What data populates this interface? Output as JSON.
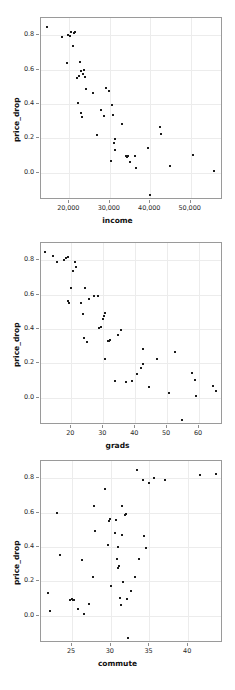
{
  "figure": {
    "width": 235,
    "height": 690,
    "background": "#ffffff",
    "point_color": "#1b1b1b",
    "grid_color": "#ececec",
    "frame_color": "#9a9a9a",
    "bottom_artifact": ""
  },
  "chart_data": [
    {
      "type": "scatter",
      "title": "",
      "xlabel": "income",
      "ylabel": "price_drop",
      "xticks": [
        20000,
        30000,
        40000,
        50000
      ],
      "xticklabels": [
        "20,000",
        "30,000",
        "40,000",
        "50,000"
      ],
      "yticks": [
        0.0,
        0.2,
        0.4,
        0.6,
        0.8
      ],
      "yticklabels": [
        "0.0",
        "0.2",
        "0.4",
        "0.6",
        "0.8"
      ],
      "xlim": [
        13000,
        58000
      ],
      "ylim": [
        -0.16,
        0.9
      ],
      "grid": true,
      "legend": "none",
      "points": [
        [
          14400,
          0.845
        ],
        [
          18200,
          0.787
        ],
        [
          19700,
          0.803
        ],
        [
          20100,
          0.795
        ],
        [
          20400,
          0.818
        ],
        [
          20900,
          0.737
        ],
        [
          21200,
          0.812
        ],
        [
          21500,
          0.82
        ],
        [
          19500,
          0.637
        ],
        [
          22600,
          0.642
        ],
        [
          22000,
          0.548
        ],
        [
          22300,
          0.56
        ],
        [
          22800,
          0.59
        ],
        [
          23300,
          0.572
        ],
        [
          23600,
          0.598
        ],
        [
          23900,
          0.555
        ],
        [
          24200,
          0.487
        ],
        [
          22100,
          0.405
        ],
        [
          23000,
          0.345
        ],
        [
          23100,
          0.325
        ],
        [
          25800,
          0.462
        ],
        [
          26900,
          0.218
        ],
        [
          28600,
          0.332
        ],
        [
          29000,
          0.495
        ],
        [
          29900,
          0.472
        ],
        [
          27800,
          0.363
        ],
        [
          30600,
          0.394
        ],
        [
          30900,
          0.333
        ],
        [
          31400,
          0.196
        ],
        [
          31000,
          0.172
        ],
        [
          31200,
          0.133
        ],
        [
          30200,
          0.068
        ],
        [
          33100,
          0.283
        ],
        [
          34000,
          0.095
        ],
        [
          34200,
          0.092
        ],
        [
          34500,
          0.098
        ],
        [
          35000,
          0.064
        ],
        [
          36200,
          0.094
        ],
        [
          36500,
          0.028
        ],
        [
          39400,
          0.141
        ],
        [
          40000,
          -0.129
        ],
        [
          42400,
          0.268
        ],
        [
          42600,
          0.225
        ],
        [
          44900,
          0.04
        ],
        [
          50600,
          0.103
        ],
        [
          55700,
          0.006
        ]
      ]
    },
    {
      "type": "scatter",
      "title": "",
      "xlabel": "grads",
      "ylabel": "price_drop",
      "xticks": [
        20,
        30,
        40,
        50,
        60
      ],
      "xticklabels": [
        "20",
        "30",
        "40",
        "50",
        "60"
      ],
      "yticks": [
        0.0,
        0.2,
        0.4,
        0.6,
        0.8
      ],
      "yticklabels": [
        "0.0",
        "0.2",
        "0.4",
        "0.6",
        "0.8"
      ],
      "xlim": [
        10.5,
        67.5
      ],
      "ylim": [
        -0.16,
        0.9
      ],
      "grid": true,
      "legend": "none",
      "points": [
        [
          11.8,
          0.845
        ],
        [
          14.4,
          0.825
        ],
        [
          15.6,
          0.787
        ],
        [
          17.6,
          0.803
        ],
        [
          18.2,
          0.812
        ],
        [
          18.9,
          0.818
        ],
        [
          19.1,
          0.563
        ],
        [
          19.2,
          0.551
        ],
        [
          20.0,
          0.637
        ],
        [
          20.6,
          0.735
        ],
        [
          21.2,
          0.787
        ],
        [
          21.6,
          0.76
        ],
        [
          22.9,
          0.553
        ],
        [
          23.8,
          0.487
        ],
        [
          24.3,
          0.64
        ],
        [
          24.0,
          0.345
        ],
        [
          24.8,
          0.325
        ],
        [
          25.4,
          0.571
        ],
        [
          27.0,
          0.594
        ],
        [
          28.3,
          0.592
        ],
        [
          28.8,
          0.405
        ],
        [
          29.3,
          0.41
        ],
        [
          29.9,
          0.46
        ],
        [
          30.1,
          0.472
        ],
        [
          30.4,
          0.495
        ],
        [
          30.5,
          0.222
        ],
        [
          31.4,
          0.332
        ],
        [
          31.8,
          0.327
        ],
        [
          32.0,
          0.334
        ],
        [
          33.6,
          0.094
        ],
        [
          34.7,
          0.366
        ],
        [
          35.5,
          0.393
        ],
        [
          37.2,
          0.092
        ],
        [
          38.9,
          0.094
        ],
        [
          40.5,
          0.135
        ],
        [
          41.8,
          0.172
        ],
        [
          42.3,
          0.196
        ],
        [
          42.6,
          0.283
        ],
        [
          44.2,
          0.064
        ],
        [
          46.8,
          0.225
        ],
        [
          50.6,
          0.028
        ],
        [
          52.6,
          0.268
        ],
        [
          54.8,
          -0.129
        ],
        [
          57.9,
          0.143
        ],
        [
          58.6,
          0.103
        ],
        [
          58.9,
          0.006
        ],
        [
          64.3,
          0.066
        ],
        [
          65.2,
          0.04
        ]
      ]
    },
    {
      "type": "scatter",
      "title": "",
      "xlabel": "commute",
      "ylabel": "price_drop",
      "xticks": [
        25,
        30,
        35,
        40
      ],
      "xticklabels": [
        "25",
        "30",
        "35",
        "40"
      ],
      "yticks": [
        0.0,
        0.2,
        0.4,
        0.6,
        0.8
      ],
      "yticklabels": [
        "0.0",
        "0.2",
        "0.4",
        "0.6",
        "0.8"
      ],
      "xlim": [
        21.0,
        44.5
      ],
      "ylim": [
        -0.16,
        0.9
      ],
      "grid": true,
      "legend": "none",
      "points": [
        [
          21.9,
          0.131
        ],
        [
          22.1,
          0.028
        ],
        [
          23.1,
          0.596
        ],
        [
          23.4,
          0.352
        ],
        [
          24.8,
          0.092
        ],
        [
          25.0,
          0.094
        ],
        [
          25.1,
          0.09
        ],
        [
          25.3,
          0.092
        ],
        [
          25.8,
          0.038
        ],
        [
          26.3,
          0.325
        ],
        [
          26.6,
          0.006
        ],
        [
          27.2,
          0.066
        ],
        [
          27.7,
          0.222
        ],
        [
          27.8,
          0.636
        ],
        [
          28.0,
          0.495
        ],
        [
          29.3,
          0.738
        ],
        [
          29.6,
          0.41
        ],
        [
          29.8,
          0.551
        ],
        [
          29.9,
          0.563
        ],
        [
          30.0,
          0.172
        ],
        [
          30.6,
          0.483
        ],
        [
          30.7,
          0.556
        ],
        [
          30.9,
          0.402
        ],
        [
          30.8,
          0.33
        ],
        [
          31.0,
          0.276
        ],
        [
          31.1,
          0.291
        ],
        [
          31.2,
          0.105
        ],
        [
          31.3,
          0.064
        ],
        [
          31.4,
          0.637
        ],
        [
          31.5,
          0.47
        ],
        [
          31.6,
          0.196
        ],
        [
          31.9,
          0.585
        ],
        [
          32.0,
          0.593
        ],
        [
          32.1,
          0.098
        ],
        [
          32.2,
          -0.129
        ],
        [
          32.6,
          0.143
        ],
        [
          33.1,
          0.225
        ],
        [
          33.4,
          0.845
        ],
        [
          33.6,
          0.327
        ],
        [
          34.2,
          0.787
        ],
        [
          34.3,
          0.462
        ],
        [
          34.5,
          0.393
        ],
        [
          35.0,
          0.77
        ],
        [
          35.6,
          0.803
        ],
        [
          37.0,
          0.787
        ],
        [
          41.5,
          0.818
        ],
        [
          43.6,
          0.827
        ]
      ]
    }
  ]
}
